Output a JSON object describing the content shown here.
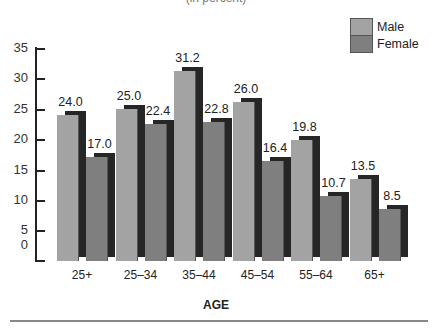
{
  "chart_data": {
    "type": "bar",
    "title": "(in percent)",
    "title_note": "title partially cut off at top of image",
    "xlabel": "AGE",
    "ylabel": "",
    "categories": [
      "25+",
      "25–34",
      "35–44",
      "45–54",
      "55–64",
      "65+"
    ],
    "series": [
      {
        "name": "Male",
        "color": "#a3a3a3",
        "values": [
          24.0,
          25.0,
          31.2,
          26.0,
          19.8,
          13.5
        ]
      },
      {
        "name": "Female",
        "color": "#7f7f7f",
        "values": [
          17.0,
          22.4,
          22.8,
          16.4,
          10.7,
          8.5
        ]
      }
    ],
    "value_labels": {
      "Male": [
        "24.0",
        "25.0",
        "31.2",
        "26.0",
        "19.8",
        "13.5"
      ],
      "Female": [
        "17.0",
        "22.4",
        "22.8",
        "16.4",
        "10.7",
        "8.5"
      ]
    },
    "yticks": [
      "35",
      "30",
      "25",
      "20",
      "15",
      "10",
      "5",
      "0"
    ],
    "ylim": [
      0,
      35
    ],
    "grid": false,
    "legend_position": "top-right",
    "bar_shadow_color": "#262626"
  }
}
